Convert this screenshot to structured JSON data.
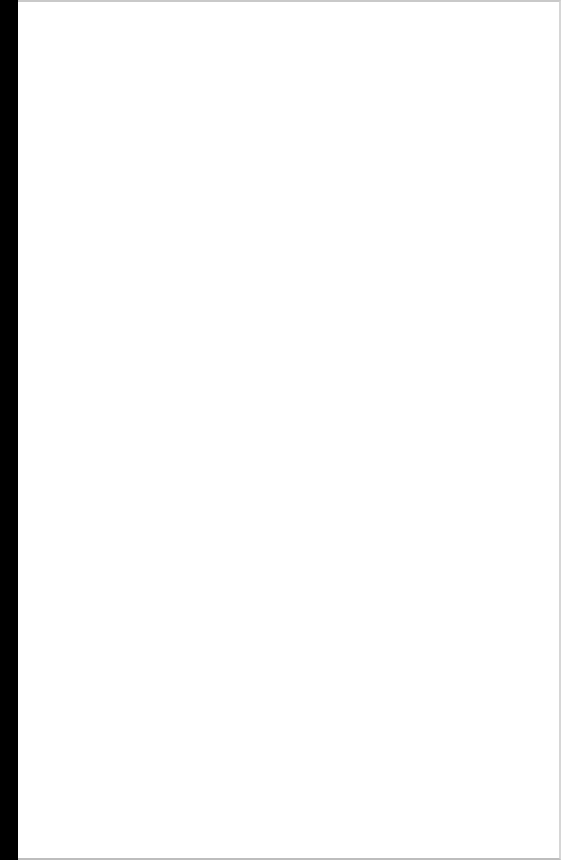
{
  "document": {
    "type": "scanned-blank-page",
    "text": "",
    "colors": {
      "paper": "#ffffff",
      "binding_edge": "#000000",
      "page_border": "#c9c9c9"
    }
  }
}
